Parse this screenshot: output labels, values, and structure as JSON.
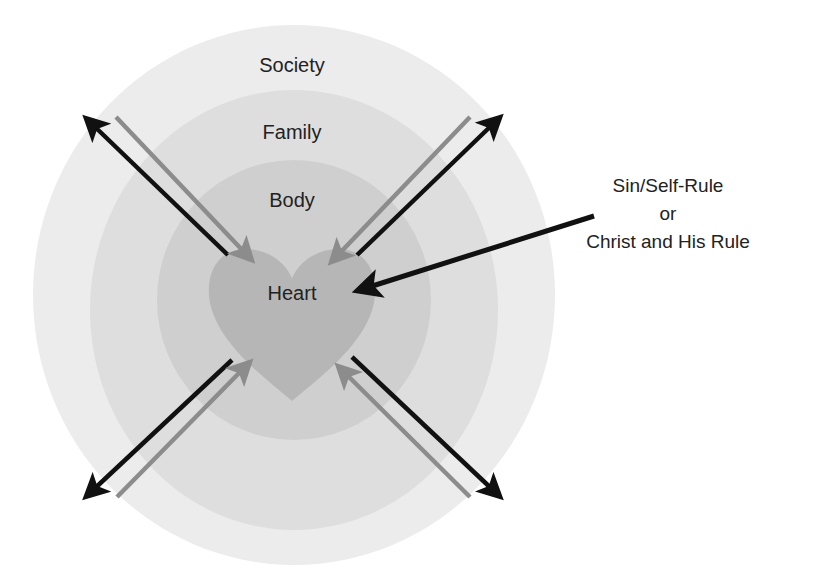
{
  "diagram": {
    "title": "",
    "rings": [
      {
        "id": "society",
        "label": "Society",
        "color": "#ececec"
      },
      {
        "id": "family",
        "label": "Family",
        "color": "#dedede"
      },
      {
        "id": "body",
        "label": "Body",
        "color": "#cfcfcf"
      },
      {
        "id": "heart",
        "label": "Heart",
        "color": "#b6b6b6"
      }
    ],
    "arrows": {
      "outward_color": "#111111",
      "inward_color": "#8c8c8c",
      "directions": [
        "top-left",
        "top-right",
        "bottom-left",
        "bottom-right"
      ]
    },
    "callout": {
      "line1": "Sin/Self-Rule",
      "line2": "or",
      "line3": "Christ and His Rule",
      "arrow_color": "#111111"
    }
  }
}
